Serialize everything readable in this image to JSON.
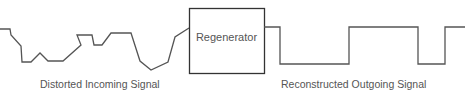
{
  "diagram": {
    "regenerator": {
      "label": "Regenerator"
    },
    "incoming": {
      "label": "Distorted Incoming Signal",
      "points": [
        [
          0,
          29
        ],
        [
          10,
          29
        ],
        [
          11,
          35
        ],
        [
          21,
          46
        ],
        [
          22,
          62
        ],
        [
          31,
          62
        ],
        [
          40,
          53
        ],
        [
          48,
          61
        ],
        [
          63,
          61
        ],
        [
          81,
          45
        ],
        [
          77,
          35
        ],
        [
          92,
          35
        ],
        [
          94,
          45
        ],
        [
          102,
          45
        ],
        [
          111,
          33
        ],
        [
          131,
          33
        ],
        [
          140,
          61
        ],
        [
          151,
          70
        ],
        [
          168,
          62
        ],
        [
          175,
          37
        ],
        [
          189,
          28
        ]
      ]
    },
    "outgoing": {
      "label": "Reconstructed Outgoing Signal",
      "points": [
        [
          264,
          27
        ],
        [
          280,
          27
        ],
        [
          280,
          64
        ],
        [
          349,
          64
        ],
        [
          349,
          27
        ],
        [
          418,
          27
        ],
        [
          418,
          64
        ],
        [
          445,
          64
        ],
        [
          445,
          27
        ],
        [
          465,
          27
        ]
      ]
    },
    "colors": {
      "line": "#555555",
      "text": "#555555",
      "box": "#333333"
    }
  }
}
